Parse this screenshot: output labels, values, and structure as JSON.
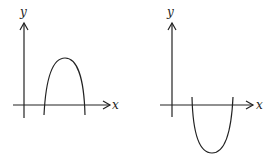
{
  "graphs": [
    {
      "id": "left",
      "x_label": "x",
      "y_label": "y",
      "curve": "downward parabola above x-axis",
      "color": "#222222"
    },
    {
      "id": "right",
      "x_label": "x",
      "y_label": "y",
      "curve": "upward parabola below x-axis",
      "color": "#222222"
    }
  ]
}
